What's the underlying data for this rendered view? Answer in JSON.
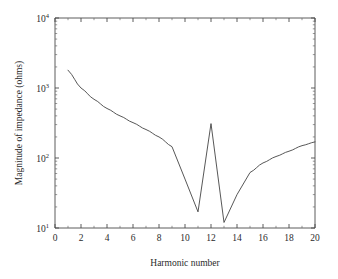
{
  "chart_data": {
    "type": "line",
    "title": "",
    "xlabel": "Harmonic number",
    "ylabel": "Magnitude of impedance (ohms)",
    "xlim": [
      0,
      20
    ],
    "ylim": [
      10,
      10000
    ],
    "yscale": "log",
    "xscale": "linear",
    "grid": false,
    "legend": null,
    "xticks": [
      0,
      2,
      4,
      6,
      8,
      10,
      12,
      14,
      16,
      18,
      20
    ],
    "xticklabels": [
      "0",
      "2",
      "4",
      "6",
      "8",
      "10",
      "12",
      "14",
      "16",
      "18",
      "20"
    ],
    "yticks": [
      10,
      100,
      1000,
      10000
    ],
    "yticklabels": [
      "10",
      "10",
      "10",
      "10"
    ],
    "yticklabels_full": [
      "10^1",
      "10^2",
      "10^3",
      "10^4"
    ],
    "yexponents": [
      "1",
      "2",
      "3",
      "4"
    ],
    "series": [
      {
        "name": "impedance",
        "color": "#444444",
        "x": [
          1,
          2,
          3,
          4,
          5,
          6,
          7,
          8,
          9,
          10,
          11,
          12,
          13,
          14,
          15,
          16,
          17,
          18,
          19,
          20
        ],
        "values": [
          1800,
          1000,
          690,
          510,
          400,
          320,
          255,
          200,
          145,
          50,
          17,
          310,
          12,
          30,
          62,
          85,
          105,
          125,
          150,
          170
        ]
      }
    ],
    "annotations": [
      {
        "label": "resonant peak",
        "x": 12,
        "y": 310
      },
      {
        "label": "anti-resonant dip",
        "x": 11,
        "y": 17
      },
      {
        "label": "anti-resonant dip",
        "x": 13,
        "y": 12
      }
    ]
  },
  "axes": {
    "x_label": "Harmonic number",
    "y_label": "Magnitude of impedance (ohms)"
  },
  "colors": {
    "curve": "#444444",
    "axis": "#4a4a4a",
    "text": "#2b2b2b",
    "background": "#ffffff"
  }
}
